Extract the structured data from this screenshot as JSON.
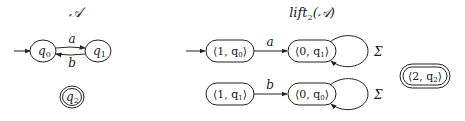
{
  "left_automaton": {
    "title": "𝒜",
    "states": [
      {
        "id": "q0",
        "label": "q",
        "sub": "0",
        "initial": true,
        "accepting": false
      },
      {
        "id": "q1",
        "label": "q",
        "sub": "1",
        "initial": false,
        "accepting": false
      },
      {
        "id": "q2",
        "label": "q",
        "sub": "2",
        "initial": false,
        "accepting": true
      }
    ],
    "transitions": [
      {
        "from": "q0",
        "to": "q1",
        "label": "a"
      },
      {
        "from": "q1",
        "to": "q0",
        "label": "b"
      }
    ]
  },
  "right_automaton": {
    "title_main": "lift",
    "title_sub": "2",
    "title_arg": "(𝒜)",
    "states": [
      {
        "id": "1q0",
        "label": "⟨1, q",
        "sub": "0",
        "close": "⟩",
        "initial": true,
        "accepting": false
      },
      {
        "id": "0q1",
        "label": "⟨0, q",
        "sub": "1",
        "close": "⟩",
        "initial": false,
        "accepting": false
      },
      {
        "id": "1q1",
        "label": "⟨1, q",
        "sub": "1",
        "close": "⟩",
        "initial": false,
        "accepting": false
      },
      {
        "id": "0q0",
        "label": "⟨0, q",
        "sub": "0",
        "close": "⟩",
        "initial": false,
        "accepting": false
      },
      {
        "id": "2q2",
        "label": "⟨2, q",
        "sub": "2",
        "close": "⟩",
        "initial": false,
        "accepting": true
      }
    ],
    "transitions": [
      {
        "from": "1q0",
        "to": "0q1",
        "label": "a"
      },
      {
        "from": "1q1",
        "to": "0q0",
        "label": "b"
      },
      {
        "from": "0q1",
        "to": "0q1",
        "label": "Σ"
      },
      {
        "from": "0q0",
        "to": "0q0",
        "label": "Σ"
      }
    ]
  }
}
